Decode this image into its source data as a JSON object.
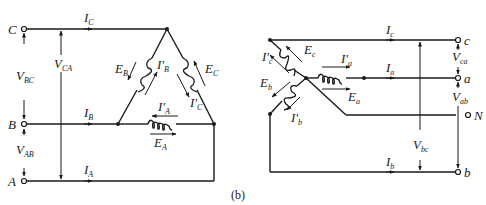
{
  "caption": "(b)",
  "delta": {
    "terminals": [
      {
        "id": "C",
        "label": "C"
      },
      {
        "id": "B",
        "label": "B"
      },
      {
        "id": "A",
        "label": "A"
      }
    ],
    "line_currents": [
      {
        "main": "I",
        "sub": "C"
      },
      {
        "main": "I",
        "sub": "B"
      },
      {
        "main": "I",
        "sub": "A"
      }
    ],
    "line_voltages": [
      {
        "main": "V",
        "sub": "BC"
      },
      {
        "main": "V",
        "sub": "CA"
      },
      {
        "main": "V",
        "sub": "AB"
      }
    ],
    "emfs": [
      {
        "main": "E",
        "sub": "A"
      },
      {
        "main": "E",
        "sub": "B"
      },
      {
        "main": "E",
        "sub": "C"
      }
    ],
    "phase_currents": [
      {
        "main": "I'",
        "sub": "A"
      },
      {
        "main": "I'",
        "sub": "B"
      },
      {
        "main": "I'",
        "sub": "C"
      }
    ]
  },
  "wye": {
    "terminals": [
      {
        "id": "c",
        "label": "c"
      },
      {
        "id": "a",
        "label": "a"
      },
      {
        "id": "N",
        "label": "N"
      },
      {
        "id": "b",
        "label": "b"
      }
    ],
    "line_currents": [
      {
        "main": "I",
        "sub": "c"
      },
      {
        "main": "I",
        "sub": "a"
      },
      {
        "main": "I",
        "sub": "b"
      }
    ],
    "line_voltages": [
      {
        "main": "V",
        "sub": "ca"
      },
      {
        "main": "V",
        "sub": "ab"
      },
      {
        "main": "V",
        "sub": "bc"
      }
    ],
    "emfs": [
      {
        "main": "E",
        "sub": "a"
      },
      {
        "main": "E",
        "sub": "b"
      },
      {
        "main": "E",
        "sub": "c"
      }
    ],
    "phase_currents": [
      {
        "main": "I'",
        "sub": "a"
      },
      {
        "main": "I'",
        "sub": "b"
      },
      {
        "main": "I'",
        "sub": "c"
      }
    ]
  }
}
